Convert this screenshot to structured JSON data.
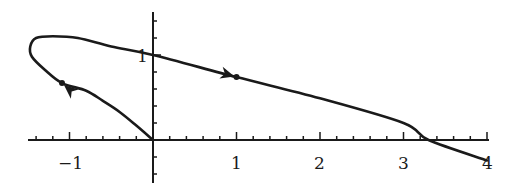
{
  "chart_data": {
    "type": "line",
    "title": "",
    "xlabel": "",
    "ylabel": "",
    "xlim": [
      -1.5,
      4.0
    ],
    "ylim": [
      -0.5,
      1.5
    ],
    "grid": false,
    "legend": null,
    "x_ticks": [
      "-1",
      "1",
      "2",
      "3",
      "4"
    ],
    "y_ticks": [
      "1"
    ],
    "series": [
      {
        "name": "trajectory",
        "color": "#1a1a1a",
        "points": [
          [
            0.0,
            0.0
          ],
          [
            -0.2,
            0.17
          ],
          [
            -0.4,
            0.33
          ],
          [
            -0.6,
            0.46
          ],
          [
            -0.8,
            0.58
          ],
          [
            -1.09,
            0.67
          ],
          [
            -1.3,
            0.83
          ],
          [
            -1.45,
            0.98
          ],
          [
            -1.47,
            1.1
          ],
          [
            -1.4,
            1.2
          ],
          [
            -1.2,
            1.22
          ],
          [
            -0.9,
            1.2
          ],
          [
            -0.5,
            1.1
          ],
          [
            0.0,
            1.0
          ],
          [
            1.0,
            0.74
          ],
          [
            2.0,
            0.49
          ],
          [
            3.0,
            0.2
          ],
          [
            3.3,
            0.0
          ],
          [
            4.0,
            -0.24
          ]
        ],
        "markers": [
          {
            "x": 1.0,
            "y": 0.74,
            "direction": "right",
            "dot": true
          },
          {
            "x": -1.09,
            "y": 0.67,
            "direction": "up-left",
            "dot": true
          }
        ]
      }
    ],
    "annotations": []
  }
}
